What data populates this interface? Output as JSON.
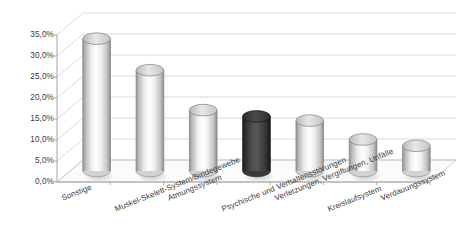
{
  "chart_data": {
    "type": "bar",
    "title": "",
    "subtitle": "",
    "xlabel": "",
    "ylabel": "",
    "categories": [
      "Sonstige",
      "Muskel-Skelett-System/Bindegewebe",
      "Atmungssystem",
      "Psychische und Verhaltensstörungen",
      "Verletzungen, Vergiftungen, Unfälle",
      "Kreislaufsystem",
      "Verdauungssystem"
    ],
    "values": [
      31.5,
      24.0,
      14.5,
      13.0,
      12.0,
      7.5,
      6.0
    ],
    "value_labels": [
      "31,5%",
      "24,0%",
      "14,5%",
      "13,0%",
      "12,0%",
      "7,5%",
      "6,0%"
    ],
    "highlighted_index": 3,
    "ylim": [
      0,
      35
    ],
    "ytick_values": [
      0,
      5,
      10,
      15,
      20,
      25,
      30,
      35
    ],
    "ytick_labels": [
      "0,0%",
      "5,0%",
      "10,0%",
      "15,0%",
      "20,0%",
      "25,0%",
      "30,0%",
      "35,0%"
    ],
    "grid": true,
    "legend": false,
    "legend_position": "none",
    "style": "3d-cylinder",
    "colors": {
      "bar_light_edge": "#9a9a9a",
      "bar_light_mid": "#fdfdfd",
      "bar_light_base": "#d2d2d2",
      "bar_highlight_edge": "#232323",
      "bar_highlight_mid": "#4e4e4e",
      "bar_highlight_base": "#3a3a3a",
      "gridline": "#c8c8c8",
      "axis": "#9a9a9a",
      "floor": "#fbfbfb",
      "text": "#3b3b3b",
      "background": "#ffffff"
    }
  }
}
